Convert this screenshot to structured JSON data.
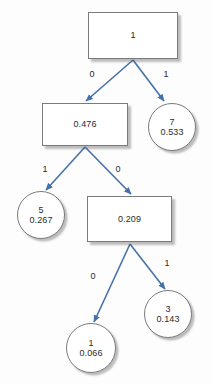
{
  "diagram": {
    "type": "decision-tree",
    "background_color": "#fdfdfd",
    "edge_color": "#4472a8",
    "node_border_color": "#7b7b7b",
    "node_fill_color": "#ffffff",
    "text_color": "#2b2b2b"
  },
  "nodes": [
    {
      "id": "root",
      "shape": "rect",
      "primary": "1",
      "secondary": "",
      "x": 88,
      "y": 12,
      "w": 90,
      "h": 47
    },
    {
      "id": "n-0476",
      "shape": "rect",
      "primary": "0.476",
      "secondary": "",
      "x": 42,
      "y": 103,
      "w": 86,
      "h": 43
    },
    {
      "id": "leaf-7",
      "shape": "circle",
      "primary": "7",
      "secondary": "0.533",
      "x": 148,
      "y": 103,
      "w": 48,
      "h": 48
    },
    {
      "id": "leaf-5",
      "shape": "circle",
      "primary": "5",
      "secondary": "0.267",
      "x": 17,
      "y": 191,
      "w": 48,
      "h": 48
    },
    {
      "id": "n-0209",
      "shape": "rect",
      "primary": "0.209",
      "secondary": "",
      "x": 87,
      "y": 196,
      "w": 85,
      "h": 46
    },
    {
      "id": "leaf-1",
      "shape": "circle",
      "primary": "1",
      "secondary": "0.066",
      "x": 66,
      "y": 323,
      "w": 50,
      "h": 50
    },
    {
      "id": "leaf-3",
      "shape": "circle",
      "primary": "3",
      "secondary": "0.143",
      "x": 144,
      "y": 290,
      "w": 48,
      "h": 48
    }
  ],
  "edges": [
    {
      "id": "root-left",
      "from": "root",
      "to": "n-0476",
      "label": "0",
      "label_x": 92,
      "label_y": 74,
      "x1": 133,
      "y1": 60,
      "x2": 86,
      "y2": 101
    },
    {
      "id": "root-right",
      "from": "root",
      "to": "leaf-7",
      "label": "1",
      "label_y": 74,
      "label_x": 166,
      "x1": 133,
      "y1": 60,
      "x2": 164,
      "y2": 101
    },
    {
      "id": "mid-left",
      "from": "n-0476",
      "to": "leaf-5",
      "label": "1",
      "label_x": 45,
      "label_y": 169,
      "x1": 85,
      "y1": 147,
      "x2": 46,
      "y2": 190
    },
    {
      "id": "mid-right",
      "from": "n-0476",
      "to": "n-0209",
      "label": "0",
      "label_x": 118,
      "label_y": 169,
      "x1": 85,
      "y1": 147,
      "x2": 131,
      "y2": 194
    },
    {
      "id": "low-left",
      "from": "n-0209",
      "to": "leaf-1",
      "label": "0",
      "label_x": 93,
      "label_y": 276,
      "x1": 130,
      "y1": 244,
      "x2": 94,
      "y2": 322
    },
    {
      "id": "low-right",
      "from": "n-0209",
      "to": "leaf-3",
      "label": "1",
      "label_x": 167,
      "label_y": 263,
      "x1": 130,
      "y1": 244,
      "x2": 165,
      "y2": 289
    }
  ]
}
